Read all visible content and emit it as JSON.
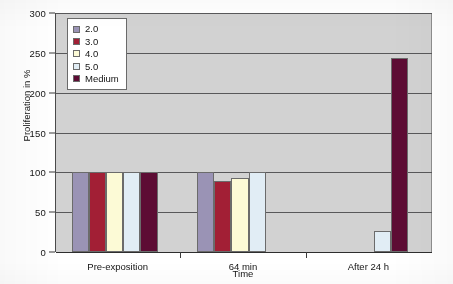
{
  "chart_data": {
    "type": "bar",
    "title": "",
    "subtitle": "",
    "xlabel": "Time",
    "ylabel": "Proliferation in %",
    "categories": [
      "Pre-exposition",
      "64 min",
      "After 24 h"
    ],
    "series": [
      {
        "name": "2.0",
        "color": "#9a93b5",
        "values": [
          100,
          100,
          0
        ]
      },
      {
        "name": "3.0",
        "color": "#a21f35",
        "values": [
          100,
          89,
          0
        ]
      },
      {
        "name": "4.0",
        "color": "#fcfad6",
        "values": [
          100,
          93,
          0
        ]
      },
      {
        "name": "5.0",
        "color": "#e1edf5",
        "values": [
          100,
          101,
          26
        ]
      },
      {
        "name": "Medium",
        "color": "#5d0c34",
        "values": [
          100,
          0,
          243
        ]
      }
    ],
    "ylim": [
      0,
      300
    ],
    "ytick_step": 50,
    "yticks": [
      "0",
      "50",
      "100",
      "150",
      "200",
      "250",
      "300"
    ],
    "grid": true,
    "legend_position": "top-left-inside",
    "plot_background": "#d2d2d2",
    "gridline_color": "#58585a",
    "axis_color": "#2e2e2e"
  },
  "legend": {
    "entries": [
      {
        "label": "2.0"
      },
      {
        "label": "3.0"
      },
      {
        "label": "4.0"
      },
      {
        "label": "5.0"
      },
      {
        "label": "Medium"
      }
    ]
  }
}
